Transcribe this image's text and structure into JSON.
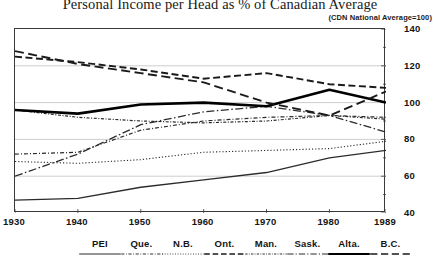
{
  "title": "Personal Income per Head as % of Canadian Average",
  "subtitle": "(CDN National Average=100)",
  "chart_data": {
    "type": "line",
    "title": "Personal Income per Head as % of Canadian Average",
    "subtitle": "(CDN National Average=100)",
    "xlabel": "",
    "ylabel": "",
    "x": [
      1930,
      1940,
      1950,
      1960,
      1970,
      1980,
      1989
    ],
    "xtick_labels": [
      "1930",
      "1940",
      "1950",
      "1960",
      "1970",
      "1980",
      "1989"
    ],
    "ylim": [
      40,
      140
    ],
    "yticks": [
      40,
      60,
      80,
      100,
      120,
      140
    ],
    "ytick_labels": [
      "40",
      "60",
      "80",
      "100",
      "120",
      "140"
    ],
    "yminor_step": 10,
    "grid": true,
    "legend_position": "below",
    "series": [
      {
        "name": "PEI",
        "style": "solid-thin",
        "color": "#2b2b2b",
        "values": [
          47,
          48,
          54,
          58,
          62,
          70,
          74
        ]
      },
      {
        "name": "Que.",
        "style": "dash-dot-fine",
        "color": "#2b2b2b",
        "values": [
          72,
          73,
          85,
          90,
          92,
          93,
          92
        ]
      },
      {
        "name": "N.B.",
        "style": "dotted-fine",
        "color": "#2b2b2b",
        "values": [
          68,
          67,
          69,
          73,
          74,
          75,
          79
        ]
      },
      {
        "name": "Ont.",
        "style": "dashed",
        "color": "#1a1a1a",
        "values": [
          125,
          122,
          118,
          113,
          116,
          110,
          108
        ]
      },
      {
        "name": "Man.",
        "style": "dash-dot-short",
        "color": "#2b2b2b",
        "values": [
          96,
          92,
          90,
          89,
          90,
          93,
          91
        ]
      },
      {
        "name": "Sask.",
        "style": "dash-dot-long",
        "color": "#2b2b2b",
        "values": [
          60,
          72,
          88,
          95,
          98,
          93,
          84
        ]
      },
      {
        "name": "Alta.",
        "style": "solid-thick",
        "color": "#000000",
        "values": [
          96,
          94,
          99,
          100,
          98,
          107,
          100
        ]
      },
      {
        "name": "B.C.",
        "style": "dashed-long",
        "color": "#1a1a1a",
        "values": [
          128,
          121,
          116,
          111,
          100,
          93,
          106
        ]
      }
    ]
  },
  "legend": {
    "items": [
      {
        "label": "PEI"
      },
      {
        "label": "Que."
      },
      {
        "label": "N.B."
      },
      {
        "label": "Ont."
      },
      {
        "label": "Man."
      },
      {
        "label": "Sask."
      },
      {
        "label": "Alta."
      },
      {
        "label": "B.C."
      }
    ]
  }
}
